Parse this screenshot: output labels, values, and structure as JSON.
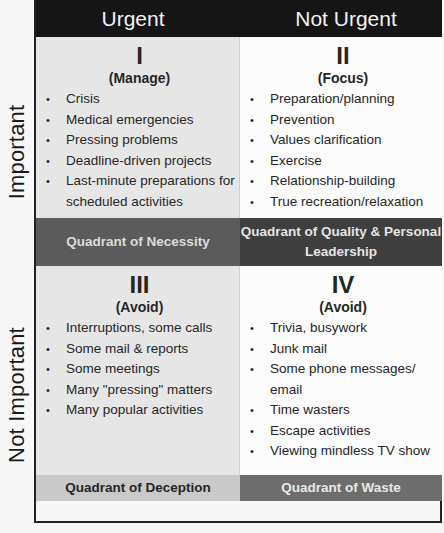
{
  "columns": {
    "left": "Urgent",
    "right": "Not Urgent"
  },
  "rows": {
    "top": "Important",
    "bottom": "Not Important"
  },
  "quadrants": [
    {
      "numeral": "I",
      "subtitle": "(Manage)",
      "items": [
        "Crisis",
        "Medical emergencies",
        "Pressing problems",
        "Deadline-driven projects",
        "Last-minute preparations for scheduled activities"
      ],
      "footer": "Quadrant of Necessity"
    },
    {
      "numeral": "II",
      "subtitle": "(Focus)",
      "items": [
        "Preparation/planning",
        "Prevention",
        "Values clarification",
        "Exercise",
        "Relationship-building",
        "True recreation/relaxation"
      ],
      "footer": "Quadrant of Quality & Personal Leadership"
    },
    {
      "numeral": "III",
      "subtitle": "(Avoid)",
      "items": [
        "Interruptions, some calls",
        "Some mail & reports",
        "Some meetings",
        "Many \"pressing\" matters",
        "Many popular activities"
      ],
      "footer": "Quadrant of Deception"
    },
    {
      "numeral": "IV",
      "subtitle": "(Avoid)",
      "items": [
        "Trivia, busywork",
        "Junk mail",
        "Some phone messages/ email",
        "Time wasters",
        "Escape activities",
        "Viewing mindless TV show"
      ],
      "footer": "Quadrant of Waste"
    }
  ],
  "colors": {
    "header_bg": "#151515",
    "q1_bg": "#e6e6e6",
    "q2_bg": "#fcfcfc",
    "footer_necessity": "#5b5b5b",
    "footer_quality": "#3f3f3f",
    "footer_deception": "#c9c9c9",
    "footer_waste": "#6d6d6d"
  }
}
